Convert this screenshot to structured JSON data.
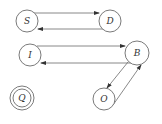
{
  "diagram": {
    "type": "state-transition graph",
    "nodes": [
      {
        "id": "S",
        "label": "S",
        "cx": 27,
        "cy": 21,
        "r": 11,
        "double": false
      },
      {
        "id": "D",
        "label": "D",
        "cx": 110,
        "cy": 21,
        "r": 11,
        "double": false
      },
      {
        "id": "I",
        "label": "I",
        "cx": 30,
        "cy": 55,
        "r": 11,
        "double": false
      },
      {
        "id": "B",
        "label": "B",
        "cx": 137,
        "cy": 53,
        "r": 12,
        "double": false
      },
      {
        "id": "Q",
        "label": "Q",
        "cx": 22,
        "cy": 98,
        "r": 12,
        "double": true
      },
      {
        "id": "O",
        "label": "O",
        "cx": 104,
        "cy": 99,
        "r": 11,
        "double": false
      }
    ],
    "edges": [
      {
        "from": "S",
        "to": "D"
      },
      {
        "from": "D",
        "to": "S"
      },
      {
        "from": "I",
        "to": "B"
      },
      {
        "from": "B",
        "to": "I"
      },
      {
        "from": "B",
        "to": "O"
      },
      {
        "from": "O",
        "to": "B"
      }
    ]
  }
}
